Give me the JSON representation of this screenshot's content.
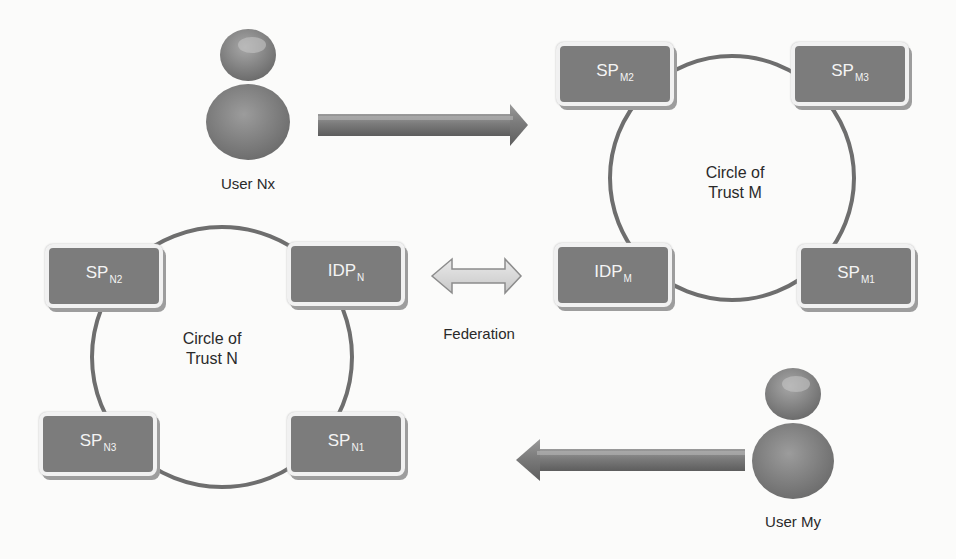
{
  "diagram": {
    "circles": [
      {
        "id": "M",
        "label_line1": "Circle of",
        "label_line2": "Trust M",
        "nodes": [
          {
            "id": "sp-m2",
            "base": "SP",
            "sub": "M2"
          },
          {
            "id": "sp-m3",
            "base": "SP",
            "sub": "M3"
          },
          {
            "id": "idp-m",
            "base": "IDP",
            "sub": "M"
          },
          {
            "id": "sp-m1",
            "base": "SP",
            "sub": "M1"
          }
        ]
      },
      {
        "id": "N",
        "label_line1": "Circle of",
        "label_line2": "Trust N",
        "nodes": [
          {
            "id": "sp-n2",
            "base": "SP",
            "sub": "N2"
          },
          {
            "id": "idp-n",
            "base": "IDP",
            "sub": "N"
          },
          {
            "id": "sp-n3",
            "base": "SP",
            "sub": "N3"
          },
          {
            "id": "sp-n1",
            "base": "SP",
            "sub": "N1"
          }
        ]
      }
    ],
    "users": [
      {
        "id": "user-nx",
        "label": "User Nx",
        "icon": "user-icon"
      },
      {
        "id": "user-my",
        "label": "User My",
        "icon": "user-icon"
      }
    ],
    "federation": {
      "label": "Federation",
      "icon": "double-arrow-icon"
    },
    "arrows": [
      {
        "id": "user-nx-arrow",
        "direction": "right",
        "from": "User Nx",
        "to": "Circle of Trust M"
      },
      {
        "id": "user-my-arrow",
        "direction": "left",
        "from": "User My",
        "to": "Circle of Trust N"
      }
    ],
    "colors": {
      "node_fill": "#7c7c7c",
      "node_border": "#f1f1f1",
      "circle_stroke": "#6e6e6e",
      "arrow_fill": "#7a7a7a",
      "federation_fill": "#d9d9d9",
      "background": "#fbfbfa"
    }
  }
}
